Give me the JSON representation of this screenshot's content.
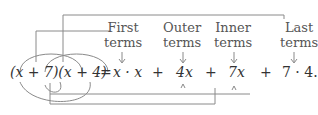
{
  "labels": {
    "first": [
      "First",
      "terms"
    ],
    "outer": [
      "Outer",
      "terms"
    ],
    "inner": [
      "Inner",
      "terms"
    ],
    "last": [
      "Last",
      "terms"
    ]
  },
  "equation": {
    "lhs": "(x + 7)(x + 4)",
    "equals": "=",
    "term1": "x · x",
    "plus1": "+",
    "term2": "4x",
    "plus2": "+",
    "term3": "7x",
    "plus3": "+",
    "term4": "7 · 4."
  },
  "colors": {
    "line": "#888888",
    "text": "#333333"
  }
}
